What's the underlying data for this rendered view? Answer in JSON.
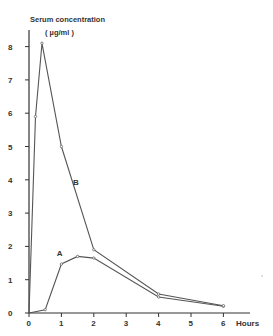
{
  "chart_data": {
    "type": "line",
    "title": "Serum concentration",
    "ylabel": "Serum concentration (µg/ml)",
    "ylabel_line1": "Serum concentration",
    "ylabel_line2": "( µg/ml )",
    "xlabel": "Hours",
    "xlim": [
      0,
      6
    ],
    "ylim": [
      0,
      8
    ],
    "x_ticks": [
      0,
      1,
      2,
      3,
      4,
      5,
      6
    ],
    "y_ticks": [
      0,
      1,
      2,
      3,
      4,
      5,
      6,
      7,
      8
    ],
    "grid": false,
    "legend": "inline labels",
    "series": [
      {
        "name": "A",
        "x": [
          0,
          0.5,
          1,
          1.5,
          2,
          4,
          6
        ],
        "values": [
          0,
          0.1,
          1.47,
          1.7,
          1.65,
          0.48,
          0.2
        ]
      },
      {
        "name": "B",
        "x": [
          0,
          0.2,
          0.4,
          1,
          2,
          4,
          6
        ],
        "values": [
          0,
          5.9,
          8.1,
          5.0,
          1.9,
          0.57,
          0.22
        ]
      }
    ],
    "annotations": [
      {
        "text": "A",
        "x": 0.95,
        "y": 1.7
      },
      {
        "text": "B",
        "x": 1.45,
        "y": 3.85
      }
    ]
  },
  "colors": {
    "line": "#555555",
    "axis": "#333333",
    "background": "#ffffff"
  }
}
